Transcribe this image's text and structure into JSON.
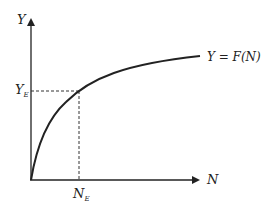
{
  "diagram": {
    "title": "",
    "y_axis_label": "Y",
    "x_axis_label": "N",
    "curve_label": "Y = F(N)",
    "equilibrium": {
      "y_label_main": "Y",
      "y_label_sub": "E",
      "x_label_main": "N",
      "x_label_sub": "E"
    },
    "colors": {
      "line": "#222222",
      "background": "#ffffff"
    }
  }
}
